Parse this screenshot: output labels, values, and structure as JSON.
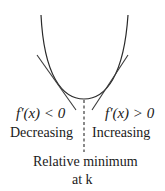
{
  "diagram": {
    "type": "relative-minimum-first-derivative-test",
    "colors": {
      "curve": "#2a2a2a",
      "tangent": "#3a3a3a",
      "dashed": "#2a2a2a",
      "text": "#1a1a1a"
    },
    "left_label": {
      "derivative": "f′(x) < 0",
      "behavior": "Decreasing"
    },
    "right_label": {
      "derivative": "f′(x) > 0",
      "behavior": "Increasing"
    },
    "caption": {
      "line1": "Relative minimum",
      "line2": "at k"
    }
  }
}
